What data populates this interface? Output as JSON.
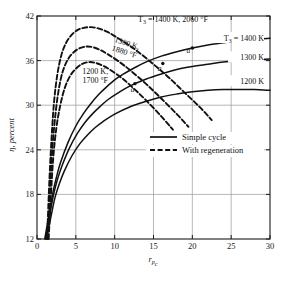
{
  "chart_data": {
    "type": "line",
    "title": "",
    "xlabel": "r_pc",
    "ylabel": "η, percent",
    "xlim": [
      0,
      30
    ],
    "ylim": [
      12,
      42
    ],
    "xticks": [
      "0",
      "5",
      "10",
      "15",
      "20",
      "25",
      "30"
    ],
    "yticks": [
      "12",
      "18",
      "24",
      "30",
      "36",
      "42"
    ],
    "grid": true,
    "legend": {
      "position": "inside-right-lower",
      "entries": [
        {
          "label": "Simple cycle",
          "style": "solid"
        },
        {
          "label": "With regeneration",
          "style": "dashed"
        }
      ]
    },
    "annotations": [
      {
        "text": "T₃ = 1400 K, 2060 °F",
        "x": 17.5,
        "y": 41.2,
        "rotation": 0
      },
      {
        "text": "1300 K, 1880 °F",
        "x": 11.5,
        "y": 38.0,
        "rotation": 18
      },
      {
        "text": "1200 K, 1700 °F",
        "x": 7.5,
        "y": 34.2,
        "rotation": 0
      },
      {
        "text": "a",
        "x": 19.5,
        "y": 37.0,
        "rotation": 0
      },
      {
        "text": "a",
        "x": 15.8,
        "y": 34.6,
        "rotation": 0
      },
      {
        "text": "a",
        "x": 12.3,
        "y": 31.8,
        "rotation": 0
      }
    ],
    "right_labels": [
      {
        "text": "T₃ = 1400 K",
        "y": 38.9
      },
      {
        "text": "1300 K",
        "y": 36.3
      },
      {
        "text": "1200 K",
        "y": 33.1
      }
    ],
    "series": [
      {
        "name": "Simple cycle, T3 = 1400 K",
        "style": "solid",
        "points": [
          [
            1.0,
            12.0
          ],
          [
            1.5,
            15.0
          ],
          [
            2.0,
            18.0
          ],
          [
            2.5,
            20.3
          ],
          [
            3.0,
            22.2
          ],
          [
            4.0,
            25.0
          ],
          [
            5.0,
            27.2
          ],
          [
            6.0,
            28.9
          ],
          [
            7.0,
            30.3
          ],
          [
            8.0,
            31.5
          ],
          [
            9.0,
            32.5
          ],
          [
            10.0,
            33.4
          ],
          [
            11.0,
            34.1
          ],
          [
            12.5,
            35.0
          ],
          [
            14.0,
            35.8
          ],
          [
            16.0,
            36.6
          ],
          [
            18.0,
            37.2
          ],
          [
            20.0,
            37.7
          ],
          [
            22.0,
            38.1
          ],
          [
            24.0,
            38.4
          ],
          [
            26.0,
            38.7
          ],
          [
            28.0,
            38.9
          ],
          [
            30.0,
            39.0
          ]
        ]
      },
      {
        "name": "Simple cycle, T3 = 1300 K",
        "style": "solid",
        "points": [
          [
            1.1,
            12.0
          ],
          [
            1.6,
            15.0
          ],
          [
            2.1,
            17.8
          ],
          [
            2.6,
            19.9
          ],
          [
            3.2,
            21.8
          ],
          [
            4.2,
            24.3
          ],
          [
            5.2,
            26.2
          ],
          [
            6.2,
            27.7
          ],
          [
            7.2,
            28.9
          ],
          [
            8.2,
            29.9
          ],
          [
            9.2,
            30.8
          ],
          [
            10.5,
            31.7
          ],
          [
            12.0,
            32.6
          ],
          [
            14.0,
            33.5
          ],
          [
            16.0,
            34.2
          ],
          [
            18.0,
            34.8
          ],
          [
            20.0,
            35.2
          ],
          [
            22.0,
            35.5
          ],
          [
            24.0,
            35.8
          ],
          [
            26.0,
            36.0
          ],
          [
            28.0,
            36.1
          ],
          [
            30.0,
            36.2
          ]
        ]
      },
      {
        "name": "Simple cycle, T3 = 1200 K",
        "style": "solid",
        "points": [
          [
            1.2,
            12.0
          ],
          [
            1.8,
            15.0
          ],
          [
            2.3,
            17.5
          ],
          [
            2.9,
            19.5
          ],
          [
            3.5,
            21.1
          ],
          [
            4.5,
            23.2
          ],
          [
            5.5,
            24.8
          ],
          [
            6.5,
            26.0
          ],
          [
            7.5,
            27.0
          ],
          [
            8.5,
            27.8
          ],
          [
            10.0,
            28.8
          ],
          [
            12.0,
            29.8
          ],
          [
            14.0,
            30.5
          ],
          [
            16.0,
            31.1
          ],
          [
            18.0,
            31.5
          ],
          [
            20.0,
            31.8
          ],
          [
            22.0,
            32.0
          ],
          [
            24.0,
            32.1
          ],
          [
            26.0,
            32.1
          ],
          [
            28.0,
            32.1
          ],
          [
            30.0,
            32.0
          ]
        ]
      },
      {
        "name": "With regeneration, T3 = 1400 K",
        "style": "dashed",
        "points": [
          [
            1.3,
            12.0
          ],
          [
            1.6,
            20.0
          ],
          [
            1.9,
            26.0
          ],
          [
            2.2,
            30.5
          ],
          [
            2.6,
            34.0
          ],
          [
            3.1,
            36.6
          ],
          [
            3.7,
            38.3
          ],
          [
            4.4,
            39.4
          ],
          [
            5.2,
            40.1
          ],
          [
            6.0,
            40.4
          ],
          [
            7.0,
            40.5
          ],
          [
            8.0,
            40.3
          ],
          [
            9.0,
            39.9
          ],
          [
            10.0,
            39.3
          ],
          [
            11.5,
            38.3
          ],
          [
            13.0,
            37.2
          ],
          [
            15.0,
            35.5
          ],
          [
            17.0,
            33.7
          ],
          [
            19.0,
            31.7
          ],
          [
            21.0,
            29.7
          ],
          [
            22.5,
            28.0
          ]
        ]
      },
      {
        "name": "With regeneration, T3 = 1300 K",
        "style": "dashed",
        "points": [
          [
            1.4,
            12.0
          ],
          [
            1.7,
            19.0
          ],
          [
            2.0,
            24.5
          ],
          [
            2.4,
            29.0
          ],
          [
            2.8,
            32.1
          ],
          [
            3.3,
            34.5
          ],
          [
            4.0,
            36.2
          ],
          [
            4.8,
            37.2
          ],
          [
            5.6,
            37.7
          ],
          [
            6.4,
            37.9
          ],
          [
            7.2,
            37.8
          ],
          [
            8.2,
            37.4
          ],
          [
            9.2,
            36.8
          ],
          [
            10.5,
            35.9
          ],
          [
            12.0,
            34.7
          ],
          [
            14.0,
            32.9
          ],
          [
            16.0,
            30.9
          ],
          [
            18.0,
            28.8
          ],
          [
            19.5,
            27.1
          ]
        ]
      },
      {
        "name": "With regeneration, T3 = 1200 K",
        "style": "dashed",
        "points": [
          [
            1.5,
            12.0
          ],
          [
            1.8,
            18.0
          ],
          [
            2.1,
            23.0
          ],
          [
            2.5,
            27.0
          ],
          [
            3.0,
            30.0
          ],
          [
            3.6,
            32.4
          ],
          [
            4.3,
            34.0
          ],
          [
            5.1,
            35.0
          ],
          [
            5.9,
            35.6
          ],
          [
            6.7,
            35.8
          ],
          [
            7.5,
            35.7
          ],
          [
            8.5,
            35.3
          ],
          [
            9.5,
            34.7
          ],
          [
            11.0,
            33.6
          ],
          [
            12.5,
            32.2
          ],
          [
            14.0,
            30.7
          ],
          [
            16.0,
            28.5
          ],
          [
            17.5,
            26.7
          ]
        ]
      }
    ]
  }
}
